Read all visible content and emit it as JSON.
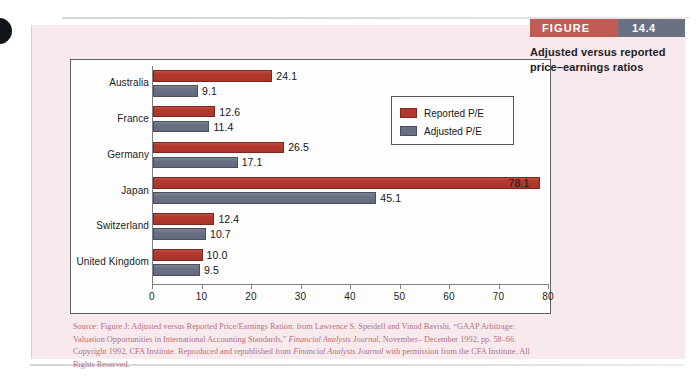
{
  "figure": {
    "tag_label": "FIGURE",
    "tag_number": "14.4",
    "caption_line1": "Adjusted versus reported",
    "caption_line2": "price–earnings ratios",
    "tag_label_color": "#c05c55",
    "tag_number_color": "#6a7180",
    "panel_color": "#f8eaec"
  },
  "source": {
    "line1_a": "Source: Figure J: Adjusted versus Reported Price/Earnings Ration: from Lawrence S. Speidell and Vinod Bavishi, “GAAP",
    "line2_a": "Arbitrage: Valuation Opportunities in International Accounting Standards,” ",
    "line2_i": "Financial Analysts Journal",
    "line2_b": ", November–",
    "line3_a": "December 1992, pp. 58–66. Copyright 1992, CFA Institute. Reproduced and republished from ",
    "line3_i": "Financial Analysts Journal",
    "line4_a": "with permission from the CFA Institute. All Rights Reserved."
  },
  "chart_data": {
    "type": "bar",
    "orientation": "horizontal",
    "title": "",
    "xlabel": "",
    "ylabel": "",
    "xlim": [
      0,
      80
    ],
    "xticks": [
      0,
      10,
      20,
      30,
      40,
      50,
      60,
      70,
      80
    ],
    "xtick_labels": [
      "0",
      "10",
      "20",
      "30",
      "40",
      "50",
      "60",
      "70",
      "80"
    ],
    "grid": false,
    "legend_position": "upper-right-inside",
    "categories": [
      "Australia",
      "France",
      "Germany",
      "Japan",
      "Switzerland",
      "United Kingdom"
    ],
    "series": [
      {
        "name": "Reported P/E",
        "color": "#b4382d",
        "values": [
          24.1,
          12.6,
          26.5,
          78.1,
          12.4,
          10.0
        ],
        "labels": [
          "24.1",
          "12.6",
          "26.5",
          "78.1",
          "12.4",
          "10.0"
        ]
      },
      {
        "name": "Adjusted P/E",
        "color": "#6a7083",
        "values": [
          9.1,
          11.4,
          17.1,
          45.1,
          10.7,
          9.5
        ],
        "labels": [
          "9.1",
          "11.4",
          "17.1",
          "45.1",
          "10.7",
          "9.5"
        ]
      }
    ]
  }
}
